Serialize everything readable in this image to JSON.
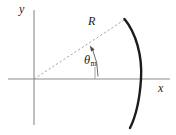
{
  "figure": {
    "axes": {
      "x_label": "x",
      "y_label": "y",
      "origin": {
        "x": 34,
        "y": 79
      },
      "x_axis": {
        "start_x": 8,
        "end_x": 170,
        "y": 79
      },
      "y_axis": {
        "x": 34,
        "start_y": 10,
        "end_y": 125
      }
    },
    "annotations": {
      "radius_label": "R",
      "angle_label": "θ",
      "angle_subscript": "m"
    },
    "elements": {
      "radius_line": {
        "name": "radius-dashed-line",
        "from": {
          "x": 34,
          "y": 79
        },
        "to": {
          "x": 124,
          "y": 20
        },
        "style": "dashed"
      },
      "angle_arc": {
        "name": "angle-marker-arc",
        "center": {
          "x": 34,
          "y": 79
        },
        "radius": 64,
        "start_angle_deg": 0,
        "end_angle_deg": 33
      },
      "angle_tick": {
        "name": "angle-reference-tick",
        "x": 95,
        "from_y": 68,
        "to_y": 79
      },
      "mirror_arc": {
        "name": "mirror-surface-arc",
        "top": {
          "x": 124,
          "y": 19
        },
        "vertex": {
          "x": 141,
          "y": 79
        },
        "bottom": {
          "x": 130,
          "y": 128
        },
        "curvature": "concave-left"
      }
    },
    "colors": {
      "axis": "#8c8c8c",
      "dashed": "#9a9a9a",
      "mirror": "#1c1c1c",
      "text": "#1c1c1c",
      "background": "#ffffff"
    }
  }
}
